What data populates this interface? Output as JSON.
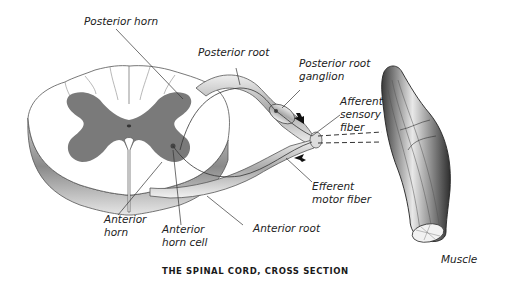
{
  "title": "THE SPINAL CORD, CROSS SECTION",
  "labels": {
    "posterior_horn": "Posterior horn",
    "posterior_root": "Posterior root",
    "posterior_root_ganglion_1": "Posterior root",
    "posterior_root_ganglion_2": "ganglion",
    "afferent_1": "Afferent",
    "afferent_2": "sensory",
    "afferent_3": "fiber",
    "efferent_1": "Efferent",
    "efferent_2": "motor fiber",
    "anterior_root": "Anterior root",
    "anterior_horn_1": "Anterior",
    "anterior_horn_2": "horn",
    "anterior_horn_cell_1": "Anterior",
    "anterior_horn_cell_2": "horn cell",
    "muscle": "Muscle"
  },
  "colors": {
    "gray_matter": "#7a7a7a",
    "white_matter": "#ffffff",
    "outline": "#555555",
    "nerve_shade": "#9a9a9a",
    "text": "#222222"
  }
}
